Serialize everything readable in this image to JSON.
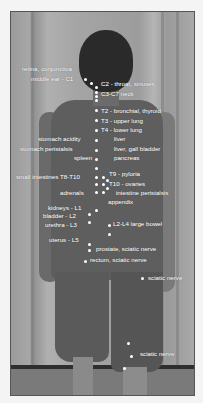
{
  "image": {
    "description": "Back view of a standing person with white dots along the spine and legs labeled with vertebral levels and associated organs",
    "labels_left": [
      {
        "text": "retina, conjunctiva",
        "x": 22,
        "y": 69
      },
      {
        "text": "middle ear - C1",
        "x": 31,
        "y": 79
      },
      {
        "text": "stomach acidity",
        "x": 38,
        "y": 139
      },
      {
        "text": "stomach peristalsis",
        "x": 20,
        "y": 149
      },
      {
        "text": "spleen",
        "x": 74,
        "y": 158
      },
      {
        "text": "small intestines T8-T10",
        "x": 16,
        "y": 177
      },
      {
        "text": "adrenals",
        "x": 60,
        "y": 193
      },
      {
        "text": "kidneys - L1",
        "x": 48,
        "y": 208
      },
      {
        "text": "bladder - L2",
        "x": 43,
        "y": 216
      },
      {
        "text": "urethra - L3",
        "x": 45,
        "y": 225
      },
      {
        "text": "uterus - L5",
        "x": 49,
        "y": 240
      }
    ],
    "labels_right": [
      {
        "text": "C2 - throat, sinuses",
        "x": 101,
        "y": 84
      },
      {
        "text": "C3-C7 neck",
        "x": 101,
        "y": 94
      },
      {
        "text": "T2 - bronchial, thyroid",
        "x": 101,
        "y": 111
      },
      {
        "text": "T3 - upper lung",
        "x": 101,
        "y": 121
      },
      {
        "text": "T4 - lower lung",
        "x": 101,
        "y": 130
      },
      {
        "text": "liver",
        "x": 114,
        "y": 139
      },
      {
        "text": "liver, gall bladder",
        "x": 114,
        "y": 149
      },
      {
        "text": "pancreas",
        "x": 114,
        "y": 158
      },
      {
        "text": "T9 - pyloria",
        "x": 109,
        "y": 174
      },
      {
        "text": "T10 - ovaries",
        "x": 109,
        "y": 184
      },
      {
        "text": "intestine peristalsis",
        "x": 116,
        "y": 193
      },
      {
        "text": "appendix",
        "x": 108,
        "y": 202
      },
      {
        "text": "L2-L4 large bowel",
        "x": 113,
        "y": 224
      },
      {
        "text": "prostate, sciatic nerve",
        "x": 96,
        "y": 249
      },
      {
        "text": "rectum, sciatic nerve",
        "x": 90,
        "y": 260
      },
      {
        "text": "sciatic nerve",
        "x": 148,
        "y": 278
      },
      {
        "text": "sciatic nerve",
        "x": 140,
        "y": 354
      }
    ],
    "dots": [
      [
        85,
        79
      ],
      [
        91,
        83
      ],
      [
        96,
        87
      ],
      [
        96,
        92
      ],
      [
        96,
        96
      ],
      [
        96,
        100
      ],
      [
        96,
        110
      ],
      [
        96,
        120
      ],
      [
        96,
        130
      ],
      [
        96,
        140
      ],
      [
        96,
        150
      ],
      [
        96,
        159
      ],
      [
        96,
        168
      ],
      [
        96,
        177
      ],
      [
        103,
        177
      ],
      [
        96,
        184
      ],
      [
        103,
        184
      ],
      [
        107,
        180
      ],
      [
        96,
        192
      ],
      [
        103,
        192
      ],
      [
        107,
        188
      ],
      [
        96,
        210
      ],
      [
        89,
        214
      ],
      [
        89,
        222
      ],
      [
        109,
        225
      ],
      [
        109,
        234
      ],
      [
        89,
        244
      ],
      [
        89,
        250
      ],
      [
        85,
        261
      ],
      [
        142,
        278
      ],
      [
        128,
        343
      ],
      [
        131,
        356
      ],
      [
        124,
        368
      ]
    ],
    "colors": {
      "dot": "#ffffff",
      "label": "#ffffff",
      "background": "#f4f4f4"
    }
  }
}
